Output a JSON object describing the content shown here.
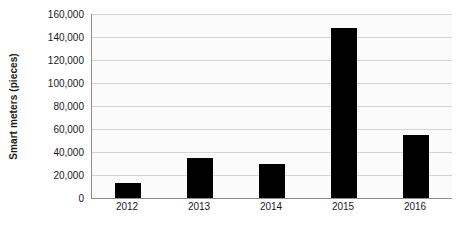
{
  "chart_data": {
    "type": "bar",
    "title": "",
    "subtitle": "",
    "xlabel": "",
    "ylabel": "Smart meters (pieces)",
    "categories": [
      "2012",
      "2013",
      "2014",
      "2015",
      "2016"
    ],
    "values": [
      13000,
      35000,
      30000,
      148000,
      55000
    ],
    "series": [
      {
        "name": "Smart meters (pieces)",
        "values": [
          13000,
          35000,
          30000,
          148000,
          55000
        ],
        "color": "#000000"
      }
    ],
    "ylim": [
      0,
      160000
    ],
    "ytick_values": [
      0,
      20000,
      40000,
      60000,
      80000,
      100000,
      120000,
      140000,
      160000
    ],
    "ytick_labels": [
      "0",
      "20,000",
      "40,000",
      "60,000",
      "80,000",
      "100,000",
      "120,000",
      "140,000",
      "160,000"
    ],
    "grid": true,
    "grid_axis": "y",
    "legend": false,
    "legend_position": "none",
    "annotations": [],
    "colors": {
      "bar": "#000000",
      "gridline": "#d4d4d4",
      "axis": "#8c8c8c",
      "plot_background": "#fbfbfb",
      "figure_background": "#ffffff",
      "text": "#1a1a1a"
    }
  }
}
